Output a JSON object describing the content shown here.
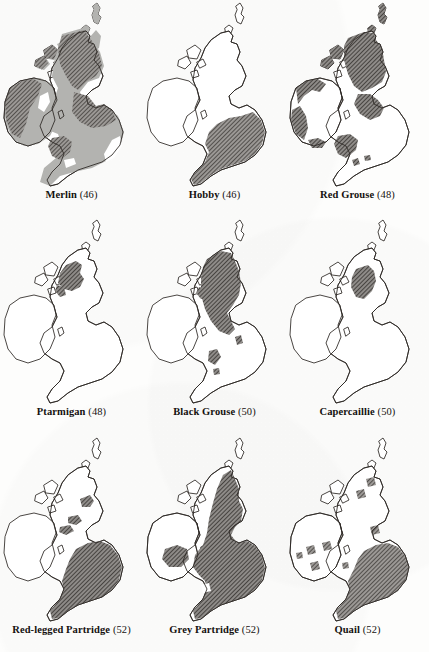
{
  "figure": {
    "type": "distribution-map-grid",
    "region": "British Isles",
    "rows": 3,
    "columns": 3,
    "background_color": "#fdfdfc",
    "outline_color": "#2a2622",
    "fill_light_color": "#b3b3b0",
    "fill_hatch_color": "#555250",
    "legend_levels": [
      "absent-white",
      "light-grey-solid",
      "dark-diagonal-hatch"
    ]
  },
  "maps": [
    {
      "id": "merlin",
      "name": "Merlin",
      "count": "(46)",
      "caption": "Merlin (46)",
      "coverage": "widespread",
      "fills": [
        "light",
        "hatch"
      ],
      "notes": "Light grey across most of Britain and Ireland with dark hatching over Scotland, northern England, Wales and western Ireland"
    },
    {
      "id": "hobby",
      "name": "Hobby",
      "count": "(46)",
      "caption": "Hobby (46)",
      "coverage": "southern-england",
      "fills": [
        "hatch"
      ],
      "notes": "Single hatched block over southern and south-eastern England only"
    },
    {
      "id": "red-grouse",
      "name": "Red Grouse",
      "count": "(48)",
      "caption": "Red Grouse (48)",
      "coverage": "upland",
      "fills": [
        "hatch",
        "light"
      ],
      "notes": "Dark hatching across Scotland, the Pennines, Wales and the Irish coastal fringe"
    },
    {
      "id": "ptarmigan",
      "name": "Ptarmigan",
      "count": "(48)",
      "caption": "Ptarmigan (48)",
      "coverage": "scottish-highlands",
      "fills": [
        "hatch"
      ],
      "notes": "Restricted to the central and western Scottish Highlands"
    },
    {
      "id": "black-grouse",
      "name": "Black Grouse",
      "count": "(50)",
      "caption": "Black Grouse (50)",
      "coverage": "scotland-north-england",
      "fills": [
        "hatch"
      ],
      "notes": "Scotland and northern England with isolated patches in Wales and the Pennines"
    },
    {
      "id": "capercaillie",
      "name": "Capercaillie",
      "count": "(50)",
      "caption": "Capercaillie (50)",
      "coverage": "east-central-scotland",
      "fills": [
        "hatch"
      ],
      "notes": "Single patch in east-central Scotland, the most restricted range shown"
    },
    {
      "id": "red-legged-partridge",
      "name": "Red-legged Partridge",
      "count": "(52)",
      "caption": "Red-legged Partridge (52)",
      "coverage": "eastern-england",
      "fills": [
        "hatch"
      ],
      "notes": "Large block over eastern and central England with small outliers in Scotland"
    },
    {
      "id": "grey-partridge",
      "name": "Grey Partridge",
      "count": "(52)",
      "caption": "Grey Partridge (52)",
      "coverage": "eastern-britain",
      "fills": [
        "hatch"
      ],
      "notes": "Most of eastern Britain from Scotland to the south coast, plus central Ireland"
    },
    {
      "id": "quail",
      "name": "Quail",
      "count": "(52)",
      "caption": "Quail (52)",
      "coverage": "southern-england-scattered",
      "fills": [
        "hatch"
      ],
      "notes": "Southern and eastern England with scattered small patches in Ireland and Scotland"
    }
  ]
}
